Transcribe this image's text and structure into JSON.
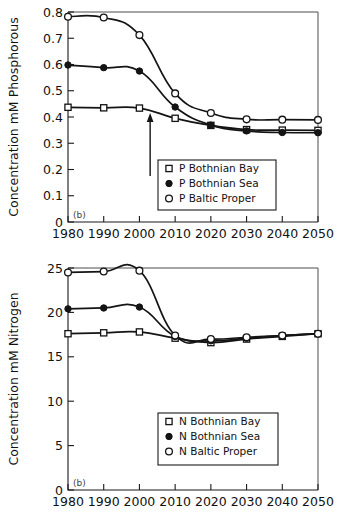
{
  "figure": {
    "background": "#ffffff",
    "line_color": "#141414",
    "width": 338,
    "height": 527
  },
  "chart_data": [
    {
      "type": "line",
      "id": "phosphorous",
      "title": "",
      "panel_tag": "(b)",
      "xlabel": "",
      "ylabel": "Concentration mM  Phosphorous",
      "x": [
        1980,
        1990,
        2000,
        2010,
        2020,
        2030,
        2040,
        2050
      ],
      "xlim": [
        1980,
        2050
      ],
      "ylim": [
        0,
        0.8
      ],
      "xticks": [
        1980,
        1990,
        2000,
        2010,
        2020,
        2030,
        2040,
        2050
      ],
      "xticklabels": [
        "1980",
        "1990",
        "2000",
        "2010",
        "2020",
        "2030",
        "2040",
        "2050"
      ],
      "yticks": [
        0,
        0.1,
        0.2,
        0.3,
        0.4,
        0.5,
        0.6,
        0.7,
        0.8
      ],
      "yticklabels": [
        "0",
        "0.1",
        "0.2",
        "0.3",
        "0.4",
        "0.5",
        "0.6",
        "0.7",
        "0.8"
      ],
      "grid": false,
      "legend_position": "lower-center-right",
      "series": [
        {
          "name": "P  Bothnian Bay",
          "marker": "open-square",
          "values": [
            0.437,
            0.435,
            0.434,
            0.395,
            0.368,
            0.352,
            0.35,
            0.349
          ]
        },
        {
          "name": "P  Bothnian Sea",
          "marker": "filled-circle",
          "values": [
            0.598,
            0.588,
            0.575,
            0.438,
            0.369,
            0.347,
            0.341,
            0.34
          ]
        },
        {
          "name": "P  Baltic Proper",
          "marker": "open-circle",
          "values": [
            0.782,
            0.779,
            0.712,
            0.49,
            0.415,
            0.391,
            0.39,
            0.389
          ]
        }
      ],
      "annotations": [
        {
          "type": "arrow-up",
          "x": 2003,
          "y_start": 0.175,
          "y_end": 0.415
        }
      ]
    },
    {
      "type": "line",
      "id": "nitrogen",
      "title": "",
      "panel_tag": "(b)",
      "xlabel": "",
      "ylabel": "Concentration mM  Nitrogen",
      "x": [
        1980,
        1990,
        2000,
        2010,
        2020,
        2030,
        2040,
        2050
      ],
      "xlim": [
        1980,
        2050
      ],
      "ylim": [
        0,
        25
      ],
      "xticks": [
        1980,
        1990,
        2000,
        2010,
        2020,
        2030,
        2040,
        2050
      ],
      "xticklabels": [
        "1980",
        "1990",
        "2000",
        "2010",
        "2020",
        "2030",
        "2040",
        "2050"
      ],
      "yticks": [
        0,
        5,
        10,
        15,
        20,
        25
      ],
      "yticklabels": [
        "0",
        "5",
        "10",
        "15",
        "20",
        "25"
      ],
      "grid": false,
      "legend_position": "lower-center-right",
      "series": [
        {
          "name": "N  Bothnian Bay",
          "marker": "open-square",
          "values": [
            17.6,
            17.7,
            17.8,
            17.1,
            16.6,
            17.0,
            17.3,
            17.6
          ]
        },
        {
          "name": "N  Bothnian Sea",
          "marker": "filled-circle",
          "values": [
            20.4,
            20.5,
            20.6,
            17.3,
            16.8,
            17.1,
            17.4,
            17.6
          ]
        },
        {
          "name": "N  Baltic Proper",
          "marker": "open-circle",
          "values": [
            24.5,
            24.6,
            24.7,
            17.4,
            17.0,
            17.2,
            17.4,
            17.6
          ]
        }
      ],
      "annotations": []
    }
  ]
}
